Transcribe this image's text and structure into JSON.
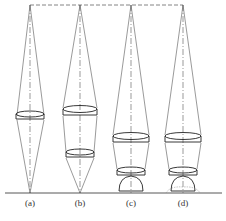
{
  "diagram": {
    "panels": [
      {
        "id": "a",
        "label": "(a)",
        "cx": 30,
        "lenses": [
          115
        ],
        "droplet": false,
        "spread": false
      },
      {
        "id": "b",
        "label": "(b)",
        "cx": 80,
        "lenses": [
          110,
          153
        ],
        "droplet": false,
        "spread": false
      },
      {
        "id": "c",
        "label": "(c)",
        "cx": 131,
        "lenses": [
          137,
          171
        ],
        "droplet": true,
        "spread": false
      },
      {
        "id": "d",
        "label": "(d)",
        "cx": 183,
        "lenses": [
          137,
          171
        ],
        "droplet": true,
        "spread": true
      }
    ],
    "colors": {
      "line": "#333333",
      "thin": "#777777"
    }
  }
}
